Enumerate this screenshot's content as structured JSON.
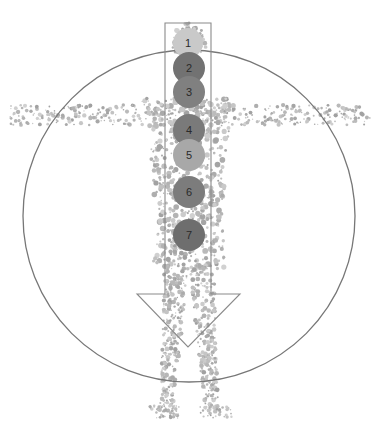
{
  "diagram": {
    "type": "chakra-body-diagram",
    "colors": {
      "background": "#ffffff",
      "outline": "#777777",
      "body_dots": "#b5b5b5",
      "label": "#2a2a2a"
    },
    "enclosing_circle": {
      "cx": 189,
      "cy": 216,
      "r": 166
    },
    "arrow": {
      "direction": "down",
      "shaft": {
        "x1": 165,
        "x2": 211,
        "top": 23,
        "bottom": 294
      },
      "head": {
        "left": 137,
        "right": 240,
        "base": 294,
        "tip_x": 188,
        "tip_y": 347
      }
    },
    "markers": [
      {
        "label": "1",
        "cx": 188,
        "cy": 43,
        "r": 15,
        "color": "#c9c9c9"
      },
      {
        "label": "2",
        "cx": 189,
        "cy": 68,
        "r": 16,
        "color": "#727272"
      },
      {
        "label": "3",
        "cx": 189,
        "cy": 92,
        "r": 16,
        "color": "#808080"
      },
      {
        "label": "4",
        "cx": 189,
        "cy": 130,
        "r": 16,
        "color": "#7a7a7a"
      },
      {
        "label": "5",
        "cx": 189,
        "cy": 155,
        "r": 16,
        "color": "#a8a8a8"
      },
      {
        "label": "6",
        "cx": 189,
        "cy": 192,
        "r": 16,
        "color": "#7c7c7c"
      },
      {
        "label": "7",
        "cx": 189,
        "cy": 235,
        "r": 16,
        "color": "#6e6e6e"
      }
    ]
  }
}
